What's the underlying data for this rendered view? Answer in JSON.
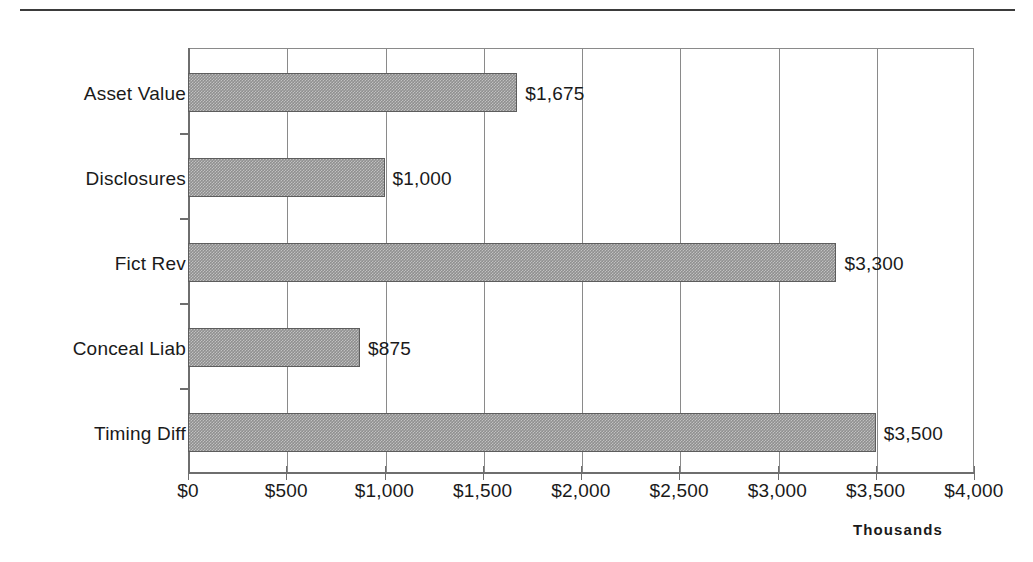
{
  "chart_data": {
    "type": "bar",
    "orientation": "horizontal",
    "title": "",
    "subtitle": "",
    "xlabel": "",
    "ylabel": "",
    "axis_unit_label": "Thousands",
    "categories": [
      "Asset Value",
      "Disclosures",
      "Fict Rev",
      "Conceal Liab",
      "Timing Diff"
    ],
    "values": [
      1675,
      1000,
      3300,
      875,
      3500
    ],
    "data_labels": [
      "$1,675",
      "$1,000",
      "$3,300",
      "$875",
      "$3,500"
    ],
    "xlim": [
      0,
      4000
    ],
    "xtick_values": [
      0,
      500,
      1000,
      1500,
      2000,
      2500,
      3000,
      3500,
      4000
    ],
    "xtick_labels": [
      "$0",
      "$500",
      "$1,000",
      "$1,500",
      "$2,000",
      "$2,500",
      "$3,000",
      "$3,500",
      "$4,000"
    ],
    "grid": "vertical",
    "legend": "none",
    "bar_fill_color": "#8f8f8f",
    "bar_border_color": "#5d5d5d",
    "axis_color": "#6e6e6e",
    "gridline_color": "#8a8a8a",
    "text_color": "#1a1a1a",
    "background_color": "#ffffff"
  },
  "page": {
    "rule_color": "#3b3b3b"
  }
}
